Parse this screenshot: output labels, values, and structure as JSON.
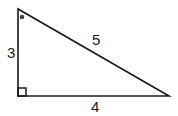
{
  "diagram": {
    "type": "right-triangle",
    "vertices": {
      "top": {
        "x": 18,
        "y": 9
      },
      "right_angle": {
        "x": 18,
        "y": 96
      },
      "right": {
        "x": 169,
        "y": 96
      }
    },
    "sides": [
      {
        "name": "vertical-leg",
        "label": "3"
      },
      {
        "name": "horizontal-leg",
        "label": "4"
      },
      {
        "name": "hypotenuse",
        "label": "5"
      }
    ],
    "markers": {
      "right_angle_square": true,
      "angle_dot_at_top_vertex": true
    },
    "colors": {
      "stroke": "#1a1a1a",
      "dot": "#444444",
      "background": "#ffffff"
    }
  }
}
